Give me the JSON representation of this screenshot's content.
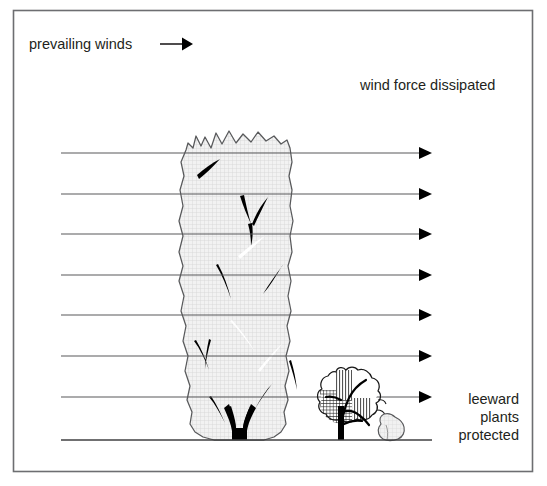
{
  "figure": {
    "title_visible": false,
    "border": {
      "color": "#6d6e71",
      "x": 13,
      "y": 10,
      "width": 520,
      "height": 462
    }
  },
  "labels": {
    "prevailing_winds": "prevailing winds",
    "wind_force_dissipated": "wind force dissipated",
    "leeward_line1": "leeward",
    "leeward_line2": "plants",
    "leeward_line3": "protected"
  },
  "colors": {
    "text": "#231f20",
    "border": "#6d6e71",
    "wind_line": "#58595b",
    "arrow_head": "#000000",
    "ground_line": "#414042",
    "hedge_fill": "#f0f0f0",
    "hedge_outline": "#58595b",
    "hedge_hatch": "#c9c9c9",
    "branch": "#000000",
    "shrub_hatch": "#1a1a1a",
    "rock_fill": "#ededed"
  },
  "wind_arrows": {
    "count": 7,
    "x_start": 61,
    "x_end": 432,
    "y_values": [
      153,
      194,
      234,
      275,
      315,
      356,
      397
    ],
    "arrowhead_length": 13,
    "arrowhead_halfwidth": 6
  },
  "prevailing_arrow": {
    "x_start": 160,
    "x_end": 193,
    "y": 44
  },
  "ground_line": {
    "x_start": 61,
    "x_end": 432,
    "y": 440
  },
  "windbreak_hedge": {
    "name": "tall dense hedge windbreak",
    "x_left": 178,
    "x_right": 292,
    "y_top": 130,
    "y_bottom": 440
  },
  "leeward_shrub": {
    "name": "small protected shrub",
    "x_left": 318,
    "x_right": 382,
    "y_top": 368,
    "y_bottom": 440
  },
  "rock": {
    "name": "small rock",
    "x_left": 377,
    "x_right": 404,
    "y_top": 414,
    "y_bottom": 440
  }
}
